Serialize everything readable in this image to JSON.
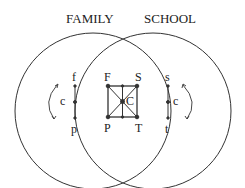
{
  "title_left": "FAMILY",
  "title_right": "SCHOOL",
  "left": {
    "top": "f",
    "bottom": "p",
    "mid": "c"
  },
  "right": {
    "top": "s",
    "bottom": "t",
    "mid": "c"
  },
  "center": {
    "tl": "F",
    "tr": "S",
    "bl": "P",
    "br": "T",
    "center": "C"
  },
  "colors": {
    "stroke": "#333333"
  }
}
